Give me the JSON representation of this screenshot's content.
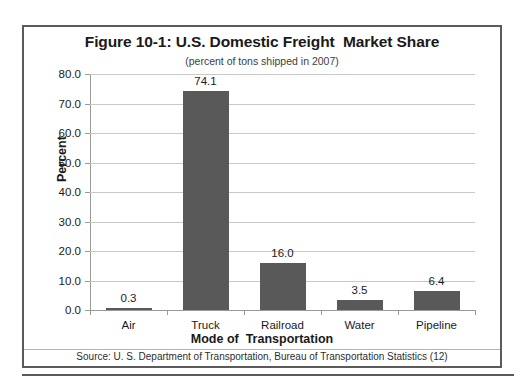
{
  "chart_data": {
    "type": "bar",
    "title": "Figure 10-1: U.S. Domestic Freight  Market Share",
    "subtitle": "(percent of tons shipped in 2007)",
    "xlabel": "Mode of  Transportation",
    "ylabel": "Percent",
    "categories": [
      "Air",
      "Truck",
      "Railroad",
      "Water",
      "Pipeline"
    ],
    "values": [
      0.3,
      74.1,
      16.0,
      3.5,
      6.4
    ],
    "value_labels": [
      "0.3",
      "74.1",
      "16.0",
      "3.5",
      "6.4"
    ],
    "ylim": [
      0.0,
      80.0
    ],
    "ytick_step": 10.0,
    "ytick_labels": [
      "80.0",
      "70.0",
      "60.0",
      "50.0",
      "40.0",
      "30.0",
      "20.0",
      "10.0",
      "0.0"
    ],
    "ytick_values": [
      80.0,
      70.0,
      60.0,
      50.0,
      40.0,
      30.0,
      20.0,
      10.0,
      0.0
    ],
    "grid": true,
    "legend": false,
    "bar_color": "#595959",
    "gridline_color": "#c9c9c9",
    "axis_color": "#9a9a9a",
    "frame_color": "#5b5b5b",
    "source": "Source: U. S. Department of Transportation, Bureau of Transportation Statistics (12)"
  }
}
